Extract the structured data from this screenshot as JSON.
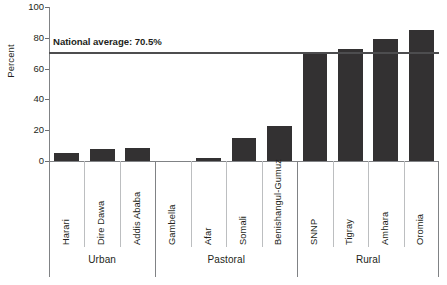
{
  "chart_data": {
    "type": "bar",
    "title": "",
    "xlabel": "",
    "ylabel": "Percent",
    "ylim": [
      0,
      100
    ],
    "yticks": [
      0,
      20,
      40,
      60,
      80,
      100
    ],
    "grid": false,
    "legend": null,
    "categories": [
      "Harari",
      "Dire Dawa",
      "Addis Ababa",
      "Gambella",
      "Afar",
      "Somali",
      "Benishangul-Gumuz",
      "SNNP",
      "Tigray",
      "Amhara",
      "Oromia"
    ],
    "values": [
      5,
      7.5,
      8.5,
      0,
      2,
      15,
      22.5,
      70,
      73,
      79.5,
      85
    ],
    "groups": [
      {
        "label": "Urban",
        "categories": [
          "Harari",
          "Dire Dawa",
          "Addis Ababa"
        ]
      },
      {
        "label": "Pastoral",
        "categories": [
          "Gambella",
          "Afar",
          "Somali",
          "Benishangul-Gumuz"
        ]
      },
      {
        "label": "Rural",
        "categories": [
          "SNNP",
          "Tigray",
          "Amhara",
          "Oromia"
        ]
      }
    ],
    "annotations": [
      {
        "name": "national-average",
        "text": "National average: 70.5%",
        "value": 70.5,
        "type": "hline"
      }
    ],
    "colors": {
      "bar": "#333132",
      "axis": "#808285",
      "avg_line": "#4d4d4f",
      "text": "#231f20",
      "separator": "#bcbec0"
    }
  }
}
